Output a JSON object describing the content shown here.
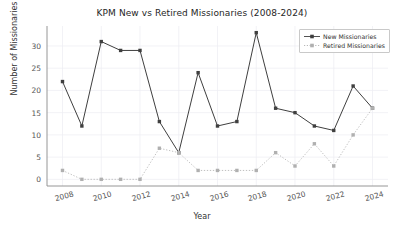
{
  "chart_data": {
    "type": "line",
    "title": "KPM New vs Retired Missionaries (2008-2024)",
    "xlabel": "Year",
    "ylabel": "Number of Missionaries",
    "x": [
      2008,
      2009,
      2010,
      2011,
      2012,
      2013,
      2014,
      2015,
      2016,
      2017,
      2018,
      2019,
      2020,
      2021,
      2022,
      2023,
      2024
    ],
    "xtick_labels": [
      "2008",
      "2010",
      "2012",
      "2014",
      "2016",
      "2018",
      "2020",
      "2022",
      "2024"
    ],
    "xticks": [
      2008,
      2010,
      2012,
      2014,
      2016,
      2018,
      2020,
      2022,
      2024
    ],
    "ytick_labels": [
      "0",
      "5",
      "10",
      "15",
      "20",
      "25",
      "30"
    ],
    "yticks": [
      0,
      5,
      10,
      15,
      20,
      25,
      30
    ],
    "xlim": [
      2007.2,
      2024.8
    ],
    "ylim": [
      -1.5,
      34.5
    ],
    "grid": true,
    "legend_position": "upper right",
    "series": [
      {
        "name": "New Missionaries",
        "color": "#3f3f3f",
        "linestyle": "solid",
        "marker": "square",
        "values": [
          22,
          12,
          31,
          29,
          29,
          13,
          6,
          24,
          12,
          13,
          33,
          16,
          15,
          12,
          11,
          21,
          16
        ]
      },
      {
        "name": "Retired Missionaries",
        "color": "#b0b0b0",
        "linestyle": "dotted",
        "marker": "square",
        "values": [
          2,
          0,
          0,
          0,
          0,
          7,
          6,
          2,
          2,
          2,
          2,
          6,
          3,
          8,
          3,
          10,
          16
        ]
      }
    ]
  },
  "legend": {
    "items": [
      {
        "label": "New Missionaries"
      },
      {
        "label": "Retired Missionaries"
      }
    ]
  }
}
